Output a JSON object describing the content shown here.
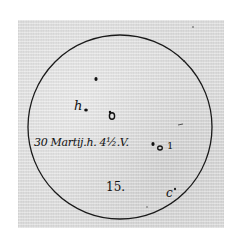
{
  "image": {
    "description": "Historical hand-drawn sunspot observation: solar disc with spot markings and annotations",
    "disc": {
      "cx": 120,
      "cy": 127,
      "r": 92,
      "stroke": "#1a1a1a"
    },
    "paper_color": "#d9d9d9"
  },
  "annotations": {
    "date_label": "30 Martij.h. 4½.V.",
    "spot_h": "h",
    "spot_1": "1",
    "spot_15": "15.",
    "spot_c": "c"
  }
}
